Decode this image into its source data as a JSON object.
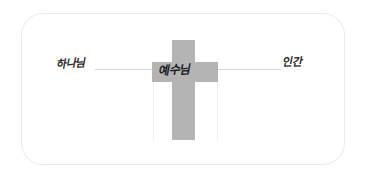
{
  "card": {
    "background_color": "#ffffff",
    "border_color": "#eaeaea"
  },
  "diagram": {
    "title_alt": "Cross mediator diagram",
    "cross": {
      "color": "#b4b4b4",
      "label": "예수님"
    },
    "connector": {
      "color": "#d6d6d6"
    },
    "guides": {
      "color": "#ededed"
    },
    "labels": {
      "left": "하나님",
      "center": "예수님",
      "right": "인간"
    }
  }
}
